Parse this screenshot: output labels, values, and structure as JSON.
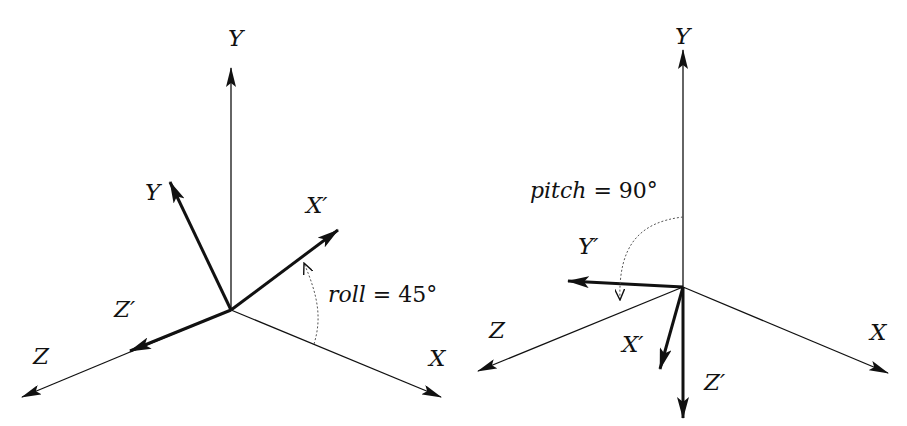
{
  "diagrams": [
    {
      "name": "roll",
      "annotation": {
        "var": "roll",
        "rest": " = 45°"
      },
      "labels": {
        "y": "Y",
        "x": "X",
        "z": "Z",
        "y_rot": "Y",
        "x_rot": "X′",
        "z_rot": "Z′"
      },
      "angle_deg": 45
    },
    {
      "name": "pitch",
      "annotation": {
        "var": "pitch",
        "rest": " = 90°"
      },
      "labels": {
        "y": "Y",
        "x": "X",
        "z": "Z",
        "y_rot": "Y′",
        "x_rot": "X′",
        "z_rot": "Z′"
      },
      "angle_deg": 90
    }
  ],
  "colors": {
    "stroke": "#111111",
    "dashed": "#555555",
    "background": "#ffffff"
  }
}
